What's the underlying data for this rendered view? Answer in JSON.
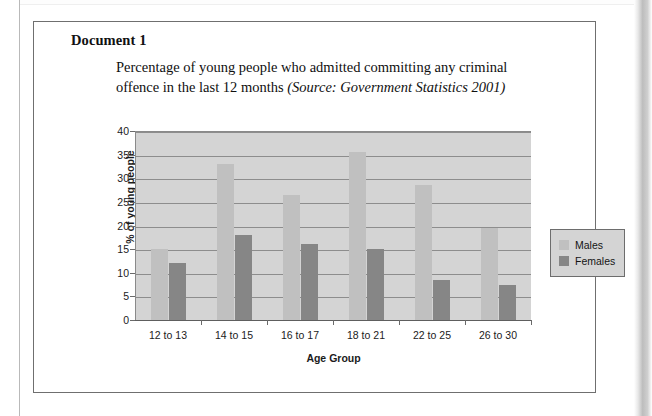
{
  "document": {
    "heading": "Document 1",
    "caption_main": "Percentage of young people who admitted committing any criminal offence in the last 12 months ",
    "caption_source": "(Source: Government Statistics 2001)"
  },
  "colors": {
    "males": "#c0c0c0",
    "females": "#868686",
    "plot_background": "#d4d4d4",
    "gridline": "#8d8d8d",
    "axis": "#5e5e5e",
    "box_border": "#6f6f6f"
  },
  "chart_data": {
    "type": "bar",
    "title": "Percentage of young people who admitted committing any criminal offence in the last 12 months (Source: Government Statistics 2001)",
    "xlabel": "Age Group",
    "ylabel": "% of young people",
    "categories": [
      "12 to 13",
      "14 to 15",
      "16 to 17",
      "18 to 21",
      "22 to 25",
      "26 to 30"
    ],
    "series": [
      {
        "name": "Males",
        "color": "#c0c0c0",
        "values": [
          15,
          33,
          26.5,
          35.5,
          28.5,
          19.5
        ]
      },
      {
        "name": "Females",
        "color": "#868686",
        "values": [
          12,
          18,
          16,
          15,
          8.5,
          7.5
        ]
      }
    ],
    "ylim": [
      0,
      40
    ],
    "yticks": [
      0,
      5,
      10,
      15,
      20,
      25,
      30,
      35,
      40
    ],
    "ytick_labels": [
      "0",
      "5",
      "10",
      "15",
      "20",
      "25",
      "30",
      "35",
      "40"
    ],
    "grid": true,
    "legend_position": "right"
  }
}
